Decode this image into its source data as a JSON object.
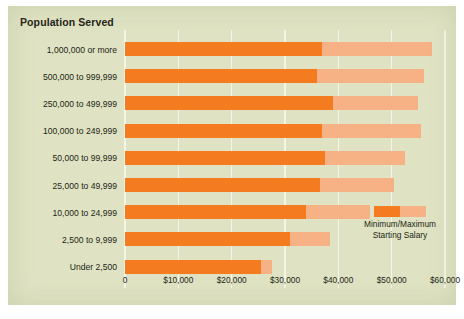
{
  "panel": {
    "background_color": "#DFE3C3",
    "header": "Population Served"
  },
  "legend": {
    "label_line1": "Minimum/Maximum",
    "label_line2": "Starting Salary",
    "min_swatch_name": "minimum-salary-swatch",
    "max_swatch_name": "maximum-salary-swatch"
  },
  "colors": {
    "minimum": "#F47B20",
    "maximum": "#F6B184",
    "panel": "#DFE3C3",
    "gridline": "#F4F5E8",
    "text": "#231F16"
  },
  "chart_data": {
    "type": "bar",
    "orientation": "horizontal",
    "stacked": true,
    "title": "Population Served",
    "xlabel": "",
    "ylabel": "Population Served",
    "xlim": [
      0,
      60000
    ],
    "grid": true,
    "legend_position": "inside-right",
    "xtick_values": [
      0,
      10000,
      20000,
      30000,
      40000,
      50000,
      60000
    ],
    "xtick_labels": [
      "0",
      "$10,000",
      "$20,000",
      "$30,000",
      "$40,000",
      "$50,000",
      "$60,000"
    ],
    "categories": [
      "1,000,000 or more",
      "500,000 to 999,999",
      "250,000 to 499,999",
      "100,000 to 249,999",
      "50,000 to 99,999",
      "25,000 to 49,999",
      "10,000 to 24,999",
      "2,500 to 9,999",
      "Under 2,500"
    ],
    "series": [
      {
        "name": "Minimum Starting Salary",
        "color": "#F47B20",
        "values": [
          37000,
          36000,
          39000,
          37000,
          37500,
          36500,
          34000,
          31000,
          25500
        ]
      },
      {
        "name": "Maximum Starting Salary",
        "color": "#F6B184",
        "values": [
          57500,
          56000,
          55000,
          55500,
          52500,
          50500,
          46000,
          38500,
          27500
        ]
      }
    ]
  }
}
